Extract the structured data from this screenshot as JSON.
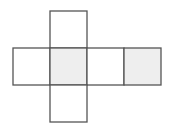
{
  "diagram": {
    "type": "cube-net",
    "stroke_color": "#555555",
    "shaded_fill": "#eeeeee",
    "plain_fill": "#ffffff",
    "cell_size": 37,
    "origin": {
      "x": 13,
      "y": 11
    },
    "faces": [
      {
        "id": "top",
        "col": 1,
        "row": 0,
        "shaded": false
      },
      {
        "id": "left",
        "col": 0,
        "row": 1,
        "shaded": false
      },
      {
        "id": "center",
        "col": 1,
        "row": 1,
        "shaded": true
      },
      {
        "id": "right",
        "col": 2,
        "row": 1,
        "shaded": false
      },
      {
        "id": "far-right",
        "col": 3,
        "row": 1,
        "shaded": true
      },
      {
        "id": "bottom",
        "col": 1,
        "row": 2,
        "shaded": false
      }
    ]
  }
}
